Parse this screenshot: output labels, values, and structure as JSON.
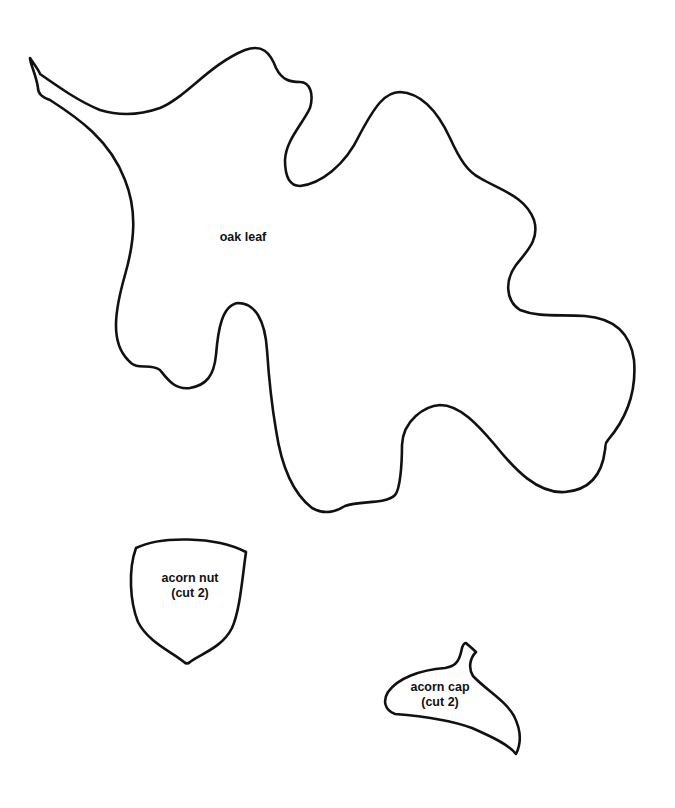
{
  "page": {
    "background": "#ffffff",
    "line_color": "#111111"
  },
  "patterns": [
    {
      "id": "oak-leaf",
      "label_line1": "oak leaf",
      "label_line2": ""
    },
    {
      "id": "acorn-nut",
      "label_line1": "acorn nut",
      "label_line2": "(cut 2)"
    },
    {
      "id": "acorn-cap",
      "label_line1": "acorn cap",
      "label_line2": "(cut 2)"
    }
  ]
}
